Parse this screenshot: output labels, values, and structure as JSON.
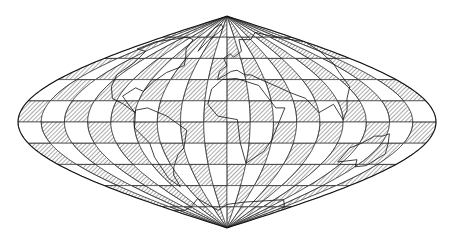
{
  "map": {
    "projection": "sinusoidal",
    "style": "interrupted checkerboard hatch",
    "colors": {
      "background": "#ffffff",
      "ink": "#1a1a1a",
      "hatch": "#555555"
    },
    "geometry": {
      "cx": 227,
      "cy": 122,
      "half_width": 209,
      "half_height": 106
    },
    "grid": {
      "rows": 10,
      "cols": 18
    },
    "labels": []
  }
}
